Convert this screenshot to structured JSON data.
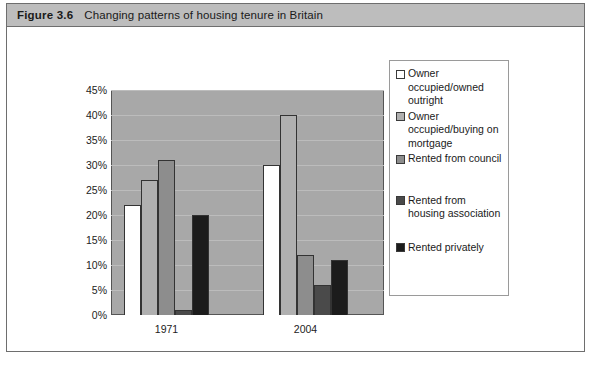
{
  "figure": {
    "number": "Figure 3.6",
    "title": "Changing patterns of housing tenure in Britain"
  },
  "source_note": "",
  "colors": {
    "plot_background": "#a8a8a8",
    "caption_background": "#bdbdbd",
    "gridline": "#bcbcbc",
    "border": "#555555"
  },
  "chart_data": {
    "type": "bar",
    "title": "Changing patterns of housing tenure in Britain",
    "xlabel": "",
    "ylabel": "",
    "categories": [
      "1971",
      "2004"
    ],
    "ylim": [
      0,
      45
    ],
    "ytick_labels": [
      "0%",
      "5%",
      "10%",
      "15%",
      "20%",
      "25%",
      "30%",
      "35%",
      "40%",
      "45%"
    ],
    "ytick_values": [
      0,
      5,
      10,
      15,
      20,
      25,
      30,
      35,
      40,
      45
    ],
    "grid": true,
    "legend_position": "right",
    "series": [
      {
        "name": "Owner occupied/owned outright",
        "color": "#ffffff",
        "values": [
          22,
          30
        ]
      },
      {
        "name": "Owner occupied/buying on mortgage",
        "color": "#b0b0b0",
        "values": [
          27,
          40
        ]
      },
      {
        "name": "Rented from council",
        "color": "#8d8d8d",
        "values": [
          31,
          12
        ]
      },
      {
        "name": "Rented from housing association",
        "color": "#4a4a4a",
        "values": [
          1,
          6
        ]
      },
      {
        "name": "Rented privately",
        "color": "#1c1c1c",
        "values": [
          20,
          11
        ]
      }
    ]
  }
}
